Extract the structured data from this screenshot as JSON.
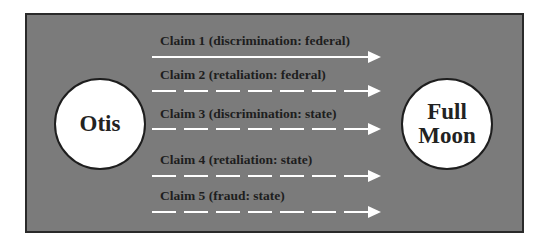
{
  "diagram": {
    "background_color": "#7b7b7b",
    "line_color": "#ffffff",
    "nodes": {
      "source": {
        "label": "Otis"
      },
      "target": {
        "label_line1": "Full",
        "label_line2": "Moon"
      }
    },
    "claims": [
      {
        "label": "Claim 1 (discrimination: federal)",
        "style": "solid"
      },
      {
        "label": "Claim 2 (retaliation: federal)",
        "style": "dashed"
      },
      {
        "label": "Claim 3 (discrimination: state)",
        "style": "dashed"
      },
      {
        "label": "Claim 4 (retaliation: state)",
        "style": "dashed"
      },
      {
        "label": "Claim 5 (fraud: state)",
        "style": "dashed"
      }
    ]
  }
}
